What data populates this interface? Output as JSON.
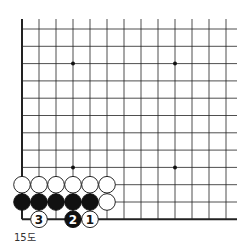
{
  "diagram": {
    "caption": "15도",
    "board": {
      "columns": 13,
      "rows": 12,
      "edges": [
        "left",
        "bottom"
      ],
      "star_points": [
        [
          3,
          2
        ],
        [
          9,
          2
        ],
        [
          3,
          8
        ],
        [
          9,
          8
        ]
      ],
      "stones": [
        {
          "color": "white",
          "col": 0,
          "row": 9
        },
        {
          "color": "white",
          "col": 1,
          "row": 9
        },
        {
          "color": "white",
          "col": 2,
          "row": 9
        },
        {
          "color": "white",
          "col": 3,
          "row": 9
        },
        {
          "color": "white",
          "col": 4,
          "row": 9
        },
        {
          "color": "white",
          "col": 5,
          "row": 9
        },
        {
          "color": "black",
          "col": 0,
          "row": 10
        },
        {
          "color": "black",
          "col": 1,
          "row": 10
        },
        {
          "color": "black",
          "col": 2,
          "row": 10
        },
        {
          "color": "black",
          "col": 3,
          "row": 10
        },
        {
          "color": "black",
          "col": 4,
          "row": 10
        },
        {
          "color": "white",
          "col": 5,
          "row": 10
        },
        {
          "color": "white",
          "col": 4,
          "row": 11,
          "label": "1"
        },
        {
          "color": "black",
          "col": 3,
          "row": 11,
          "label": "2"
        },
        {
          "color": "white",
          "col": 1,
          "row": 11,
          "label": "3"
        }
      ]
    }
  }
}
